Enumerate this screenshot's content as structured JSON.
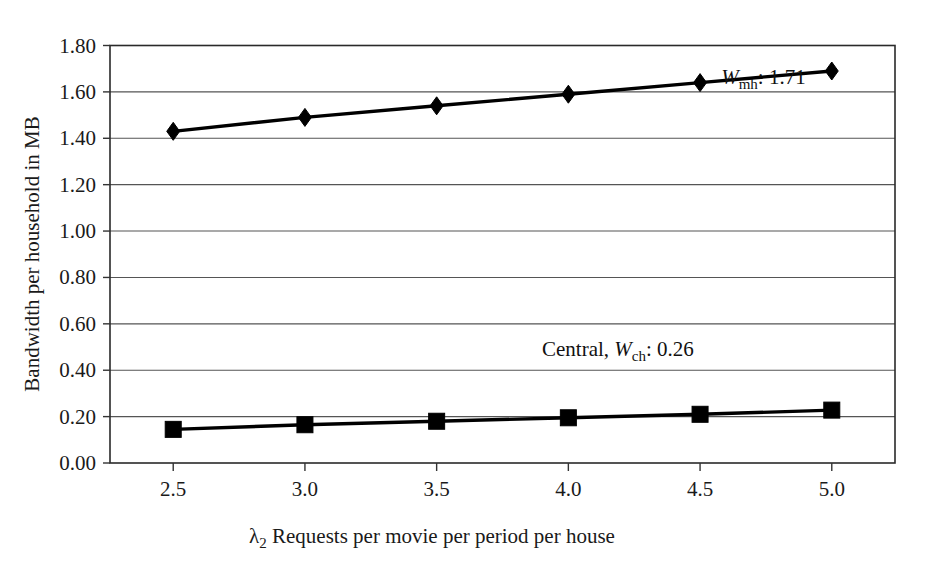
{
  "chart_data": {
    "type": "line",
    "title": "",
    "xlabel": "λ2 Requests per movie per period per house",
    "xlabel_prefix": "λ",
    "xlabel_sub": "2",
    "xlabel_rest": " Requests per movie per period per house",
    "ylabel": "Bandwidth per household in MB",
    "x": [
      2.5,
      3.0,
      3.5,
      4.0,
      4.5,
      5.0
    ],
    "xticklabels": [
      "2.5",
      "3.0",
      "3.5",
      "4.0",
      "4.5",
      "5.0"
    ],
    "xlim": [
      2.26,
      5.24
    ],
    "ylim": [
      0.0,
      1.8
    ],
    "yticks": [
      0.0,
      0.2,
      0.4,
      0.6,
      0.8,
      1.0,
      1.2,
      1.4,
      1.6,
      1.8
    ],
    "yticklabels": [
      "0.00",
      "0.20",
      "0.40",
      "0.60",
      "0.80",
      "1.00",
      "1.20",
      "1.40",
      "1.60",
      "1.80"
    ],
    "grid": "horizontal",
    "legend_position": "inline-annotations",
    "series": [
      {
        "name": "Wmh",
        "marker": "diamond",
        "color": "#000000",
        "values": [
          1.43,
          1.49,
          1.54,
          1.59,
          1.64,
          1.69
        ]
      },
      {
        "name": "Central Wch",
        "marker": "square",
        "color": "#000000",
        "values": [
          0.145,
          0.165,
          0.18,
          0.195,
          0.21,
          0.228
        ]
      }
    ],
    "annotations": [
      {
        "id": "wmh-label",
        "italic": "W",
        "sub": "mh",
        "rest": ": 1.71",
        "x": 4.58,
        "y": 1.635,
        "anchor": "start"
      },
      {
        "id": "wch-label",
        "prefix": "Central, ",
        "italic": "W",
        "sub": "ch",
        "rest": ": 0.26",
        "x": 3.9,
        "y": 0.46,
        "anchor": "start"
      }
    ]
  }
}
